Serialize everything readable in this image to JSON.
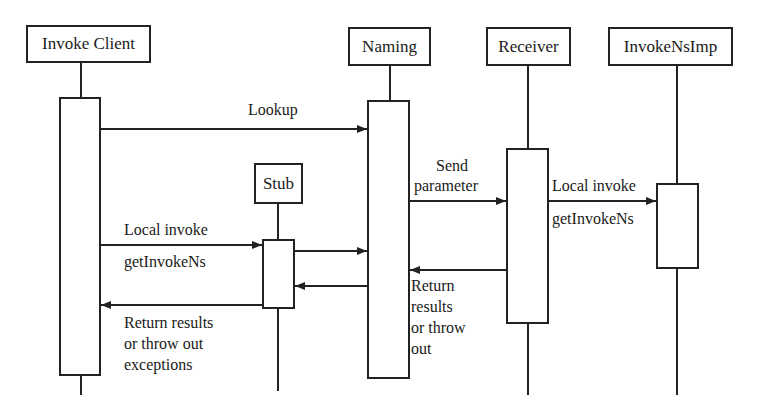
{
  "diagram": {
    "type": "sequence-diagram",
    "participants": [
      {
        "id": "client",
        "label": "Invoke Client"
      },
      {
        "id": "naming",
        "label": "Naming"
      },
      {
        "id": "receiver",
        "label": "Receiver"
      },
      {
        "id": "impl",
        "label": "InvokeNsImp"
      },
      {
        "id": "stub",
        "label": "Stub"
      }
    ],
    "messages": [
      {
        "from": "client",
        "to": "naming",
        "label": "Lookup"
      },
      {
        "from": "client",
        "to": "stub",
        "label_above": "Local invoke",
        "label_below": "getInvokeNs"
      },
      {
        "from": "stub",
        "to": "naming",
        "label": ""
      },
      {
        "from": "naming",
        "to": "receiver",
        "label_line1": "Send",
        "label_line2": "parameter"
      },
      {
        "from": "receiver",
        "to": "impl",
        "label_above": "Local invoke",
        "label_below": "getInvokeNs"
      },
      {
        "from": "receiver",
        "to": "naming",
        "label_lines": [
          "Return",
          "results",
          "or throw",
          "out"
        ]
      },
      {
        "from": "naming",
        "to": "stub",
        "label": ""
      },
      {
        "from": "stub",
        "to": "client",
        "label_lines": [
          "Return results",
          "or throw out",
          "exceptions"
        ]
      }
    ],
    "colors": {
      "line": "#222222",
      "background": "#ffffff",
      "text": "#1a1a1a"
    }
  }
}
